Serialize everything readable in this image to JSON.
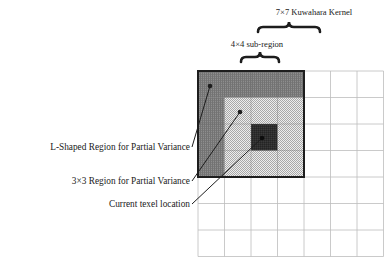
{
  "figure": {
    "type": "diagram",
    "topic": "Kuwahara filter kernel sub-region decomposition",
    "background_color": "#ffffff",
    "grid": {
      "name": "7x7 Kuwahara Kernel grid",
      "columns": 7,
      "rows": 7,
      "origin_x": 198,
      "origin_y": 71,
      "cell_size": 26.5,
      "line_color": "#b8b8b8",
      "line_width": 0.8
    },
    "regions": [
      {
        "id": "sub_region",
        "label": "4x4 sub-region",
        "col": 0,
        "row": 0,
        "cols": 4,
        "rows": 4,
        "border_color": "#1d1d1d",
        "border_width": 2
      },
      {
        "id": "l_shaped_region",
        "label": "L-Shaped Region for Partial Variance",
        "description": "top row and left column of the 4x4 sub-region",
        "fill_color": "#8a8a8a",
        "pattern": "fine-cross-hatch"
      },
      {
        "id": "inner_3x3_region",
        "label": "3x3 Region for Partial Variance",
        "col": 1,
        "row": 1,
        "cols": 3,
        "rows": 3,
        "fill_color": "#d2d2d2",
        "pattern": "fine-checkerboard"
      },
      {
        "id": "current_texel",
        "label": "Current texel location",
        "col": 2,
        "row": 2,
        "cols": 1,
        "rows": 1,
        "fill_color": "#2b2b2b",
        "pattern": "dark-solid"
      }
    ]
  },
  "labels": {
    "l_shaped": "L-Shaped Region for Partial Variance",
    "region_3x3": "3×3 Region for Partial Variance",
    "current_texel": "Current texel location",
    "sub_region": "4×4 sub-region",
    "kernel": "7×7 Kuwahara Kernel"
  },
  "braces": [
    {
      "name": "sub-region-brace",
      "for": "4×4 sub-region",
      "x_start": 241,
      "x_end": 279,
      "y": 57,
      "color": "#1d1d1d"
    },
    {
      "name": "kernel-brace",
      "for": "7×7 Kuwahara Kernel",
      "x_start": 258,
      "x_end": 320,
      "y": 27,
      "color": "#1d1d1d"
    }
  ],
  "leader_lines": [
    {
      "name": "leader-l-shaped",
      "from_x": 192,
      "from_y": 147,
      "to_x": 210,
      "to_y": 86,
      "dot_x": 210,
      "dot_y": 86,
      "color": "#1d1d1d"
    },
    {
      "name": "leader-3x3",
      "from_x": 192,
      "from_y": 181,
      "to_x": 240,
      "to_y": 112,
      "dot_x": 240,
      "dot_y": 112,
      "color": "#1d1d1d"
    },
    {
      "name": "leader-texel",
      "from_x": 192,
      "from_y": 204,
      "to_x": 262,
      "to_y": 138,
      "dot_x": 262,
      "dot_y": 138,
      "color": "#1d1d1d"
    }
  ]
}
